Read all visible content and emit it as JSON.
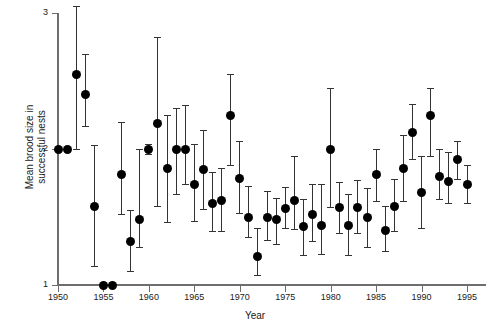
{
  "chart_data": {
    "type": "scatter",
    "title": "",
    "xlabel": "Year",
    "ylabel": "Mean brood size in successful nests",
    "xlim": [
      1949,
      1996
    ],
    "ylim": [
      1,
      3
    ],
    "xticks": [
      1950,
      1955,
      1960,
      1965,
      1970,
      1975,
      1980,
      1985,
      1990,
      1995
    ],
    "yticks": [
      1,
      2,
      3
    ],
    "grid": false,
    "legend": null,
    "error_bars": "vertical, capped (95% confidence / SE range)",
    "marker": "filled black circle",
    "points": [
      {
        "year": 1950,
        "value": 2.0,
        "low": 2.0,
        "high": 2.0
      },
      {
        "year": 1951,
        "value": 2.0,
        "low": 2.0,
        "high": 2.0
      },
      {
        "year": 1952,
        "value": 2.55,
        "low": 2.0,
        "high": 3.05
      },
      {
        "year": 1953,
        "value": 2.4,
        "low": 2.17,
        "high": 2.7
      },
      {
        "year": 1954,
        "value": 1.58,
        "low": 1.14,
        "high": 2.03
      },
      {
        "year": 1955,
        "value": 1.0,
        "low": 1.0,
        "high": 1.0
      },
      {
        "year": 1956,
        "value": 1.0,
        "low": 1.0,
        "high": 1.0
      },
      {
        "year": 1957,
        "value": 1.81,
        "low": 1.52,
        "high": 2.2
      },
      {
        "year": 1958,
        "value": 1.32,
        "low": 1.1,
        "high": 1.55
      },
      {
        "year": 1959,
        "value": 1.48,
        "low": 1.28,
        "high": 2.0
      },
      {
        "year": 1960,
        "value": 2.0,
        "low": 1.96,
        "high": 2.04
      },
      {
        "year": 1961,
        "value": 2.19,
        "low": 1.58,
        "high": 2.82
      },
      {
        "year": 1962,
        "value": 1.86,
        "low": 1.46,
        "high": 2.25
      },
      {
        "year": 1963,
        "value": 2.0,
        "low": 1.67,
        "high": 2.3
      },
      {
        "year": 1964,
        "value": 2.0,
        "low": 1.74,
        "high": 2.32
      },
      {
        "year": 1965,
        "value": 1.74,
        "low": 1.47,
        "high": 2.04
      },
      {
        "year": 1966,
        "value": 1.85,
        "low": 1.56,
        "high": 2.14
      },
      {
        "year": 1967,
        "value": 1.6,
        "low": 1.4,
        "high": 1.83
      },
      {
        "year": 1968,
        "value": 1.62,
        "low": 1.4,
        "high": 1.86
      },
      {
        "year": 1969,
        "value": 2.25,
        "low": 1.88,
        "high": 2.55
      },
      {
        "year": 1970,
        "value": 1.78,
        "low": 1.53,
        "high": 2.06
      },
      {
        "year": 1971,
        "value": 1.5,
        "low": 1.35,
        "high": 1.73
      },
      {
        "year": 1972,
        "value": 1.21,
        "low": 1.07,
        "high": 1.42
      },
      {
        "year": 1973,
        "value": 1.5,
        "low": 1.33,
        "high": 1.69
      },
      {
        "year": 1974,
        "value": 1.48,
        "low": 1.3,
        "high": 1.64
      },
      {
        "year": 1975,
        "value": 1.56,
        "low": 1.42,
        "high": 1.72
      },
      {
        "year": 1976,
        "value": 1.62,
        "low": 1.41,
        "high": 1.95
      },
      {
        "year": 1977,
        "value": 1.43,
        "low": 1.22,
        "high": 1.63
      },
      {
        "year": 1978,
        "value": 1.52,
        "low": 1.32,
        "high": 1.74
      },
      {
        "year": 1979,
        "value": 1.44,
        "low": 1.23,
        "high": 1.74
      },
      {
        "year": 1980,
        "value": 2.0,
        "low": 1.57,
        "high": 2.45
      },
      {
        "year": 1981,
        "value": 1.57,
        "low": 1.38,
        "high": 1.76
      },
      {
        "year": 1982,
        "value": 1.44,
        "low": 1.22,
        "high": 1.67
      },
      {
        "year": 1983,
        "value": 1.57,
        "low": 1.38,
        "high": 1.77
      },
      {
        "year": 1984,
        "value": 1.5,
        "low": 1.28,
        "high": 1.71
      },
      {
        "year": 1985,
        "value": 1.81,
        "low": 1.62,
        "high": 2.0
      },
      {
        "year": 1986,
        "value": 1.4,
        "low": 1.25,
        "high": 1.58
      },
      {
        "year": 1987,
        "value": 1.58,
        "low": 1.4,
        "high": 1.78
      },
      {
        "year": 1988,
        "value": 1.86,
        "low": 1.62,
        "high": 2.1
      },
      {
        "year": 1989,
        "value": 2.12,
        "low": 1.93,
        "high": 2.33
      },
      {
        "year": 1990,
        "value": 1.68,
        "low": 1.42,
        "high": 1.95
      },
      {
        "year": 1991,
        "value": 2.25,
        "low": 1.95,
        "high": 2.45
      },
      {
        "year": 1992,
        "value": 1.8,
        "low": 1.63,
        "high": 2.0
      },
      {
        "year": 1993,
        "value": 1.76,
        "low": 1.6,
        "high": 1.98
      },
      {
        "year": 1994,
        "value": 1.92,
        "low": 1.78,
        "high": 2.06
      },
      {
        "year": 1995,
        "value": 1.74,
        "low": 1.6,
        "high": 1.88
      }
    ]
  },
  "axes": {
    "x_title": "Year",
    "y_title": "Mean brood size in\nsuccessful nests",
    "x_tick_labels": [
      "1950",
      "1955",
      "1960",
      "1965",
      "1970",
      "1975",
      "1980",
      "1985",
      "1990",
      "1995"
    ],
    "y_tick_labels": [
      "1",
      "2",
      "3"
    ]
  },
  "colors": {
    "marker": "#000000",
    "error_bar": "#333333",
    "axis": "#6d6d6d",
    "text": "#1a1a1a",
    "background": "#ffffff"
  }
}
